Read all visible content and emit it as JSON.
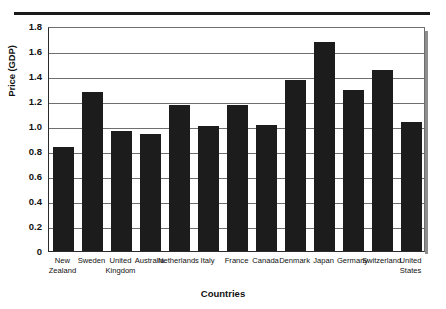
{
  "chart_data": {
    "type": "bar",
    "title": "",
    "xlabel": "Countries",
    "ylabel": "Price (GDP)",
    "ylim": [
      0,
      1.8
    ],
    "ytick_labels": [
      "1.8",
      "1.6",
      "1.4",
      "1.2",
      "1.0",
      "0.8",
      "0.6",
      "0.4",
      "0.2",
      "0"
    ],
    "ytick_values": [
      1.8,
      1.6,
      1.4,
      1.2,
      1.0,
      0.8,
      0.6,
      0.4,
      0.2,
      0
    ],
    "grid": true,
    "legend": "none",
    "bar_color": "#1c1c1c",
    "categories": [
      "New Zealand",
      "Sweden",
      "United Kingdom",
      "Australia",
      "Netherlands",
      "Italy",
      "France",
      "Canada",
      "Denmark",
      "Japan",
      "Germany",
      "Switzerland",
      "United States"
    ],
    "category_lines": [
      "New\nZealand",
      "Sweden",
      "United\nKingdom",
      "Australia",
      "Netherlands",
      "Italy",
      "France",
      "Canada",
      "Denmark",
      "Japan",
      "Germany",
      "Switzerland",
      "United\nStates"
    ],
    "values": [
      0.83,
      1.27,
      0.96,
      0.94,
      1.17,
      1.0,
      1.17,
      1.01,
      1.37,
      1.67,
      1.29,
      1.45,
      1.03
    ]
  }
}
